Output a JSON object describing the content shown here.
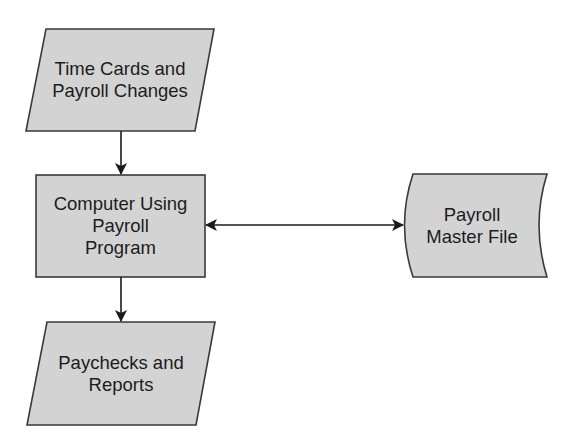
{
  "diagram": {
    "type": "flowchart",
    "colors": {
      "shape_fill": "#d3d3d3",
      "shape_stroke": "#3a3a3a",
      "arrow": "#1a1a1a",
      "text": "#1c1c1c",
      "background": "#ffffff"
    },
    "nodes": [
      {
        "id": "input",
        "shape": "parallelogram",
        "label": "Time Cards and\nPayroll Changes"
      },
      {
        "id": "process",
        "shape": "rectangle",
        "label": "Computer Using\nPayroll\nProgram"
      },
      {
        "id": "master",
        "shape": "stored-data",
        "label": "Payroll\nMaster File"
      },
      {
        "id": "output",
        "shape": "parallelogram",
        "label": "Paychecks and\nReports"
      }
    ],
    "edges": [
      {
        "from": "input",
        "to": "process",
        "direction": "forward"
      },
      {
        "from": "process",
        "to": "master",
        "direction": "bidirectional"
      },
      {
        "from": "process",
        "to": "output",
        "direction": "forward"
      }
    ]
  }
}
